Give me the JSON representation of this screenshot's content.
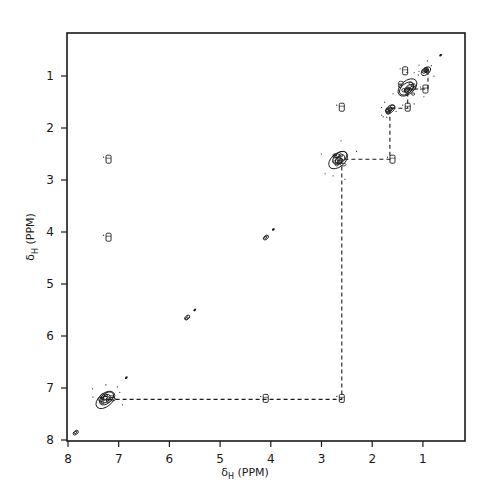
{
  "chart_data": {
    "type": "heatmap",
    "subtype": "2D COSY NMR contour plot",
    "title": "",
    "xlabel": "δH (PPM)",
    "ylabel": "δH (PPM)",
    "xlabel_main": "δ",
    "xlabel_sub": "H",
    "xlabel_unit": "(PPM)",
    "ylabel_main": "δ",
    "ylabel_sub": "H",
    "ylabel_unit": "(PPM)",
    "xlim": [
      8.0,
      0.17
    ],
    "ylim": [
      8.0,
      0.17
    ],
    "x_reversed": true,
    "y_reversed": true,
    "grid": false,
    "x_ticks": [
      8,
      7,
      6,
      5,
      4,
      3,
      2,
      1
    ],
    "y_ticks": [
      1,
      2,
      3,
      4,
      5,
      6,
      7,
      8
    ],
    "x_tick_labels": [
      "8",
      "7",
      "6",
      "5",
      "4",
      "3",
      "2",
      "1"
    ],
    "y_tick_labels": [
      "1",
      "2",
      "3",
      "4",
      "5",
      "6",
      "7",
      "8"
    ],
    "diagonal_peaks": [
      {
        "x": 7.85,
        "y": 7.85,
        "size": "small"
      },
      {
        "x": 7.25,
        "y": 7.2,
        "size": "large"
      },
      {
        "x": 6.85,
        "y": 6.8,
        "size": "tiny"
      },
      {
        "x": 5.65,
        "y": 5.65,
        "size": "small"
      },
      {
        "x": 5.5,
        "y": 5.5,
        "size": "tiny"
      },
      {
        "x": 4.1,
        "y": 4.1,
        "size": "small"
      },
      {
        "x": 3.95,
        "y": 3.95,
        "size": "tiny"
      },
      {
        "x": 2.65,
        "y": 2.6,
        "size": "large"
      },
      {
        "x": 1.65,
        "y": 1.65,
        "size": "medium"
      },
      {
        "x": 1.3,
        "y": 1.25,
        "size": "large"
      },
      {
        "x": 0.95,
        "y": 0.9,
        "size": "medium"
      },
      {
        "x": 0.65,
        "y": 0.6,
        "size": "tiny"
      }
    ],
    "cross_peaks": [
      {
        "x": 2.6,
        "y": 7.2
      },
      {
        "x": 7.2,
        "y": 2.6
      },
      {
        "x": 7.2,
        "y": 4.1
      },
      {
        "x": 4.1,
        "y": 7.2
      },
      {
        "x": 1.6,
        "y": 2.6
      },
      {
        "x": 2.6,
        "y": 1.6
      },
      {
        "x": 1.3,
        "y": 1.6
      },
      {
        "x": 0.95,
        "y": 1.25
      },
      {
        "x": 1.35,
        "y": 0.9
      }
    ],
    "connectivity_path": [
      {
        "x": 7.2,
        "y": 7.22
      },
      {
        "x": 2.6,
        "y": 7.22
      },
      {
        "x": 2.6,
        "y": 2.6
      },
      {
        "x": 1.65,
        "y": 2.6
      },
      {
        "x": 1.65,
        "y": 1.62
      },
      {
        "x": 1.3,
        "y": 1.62
      },
      {
        "x": 1.3,
        "y": 1.25
      },
      {
        "x": 0.9,
        "y": 1.25
      },
      {
        "x": 0.9,
        "y": 0.95
      }
    ],
    "annotations": [
      "dashed lines trace scalar coupling network 7.2 → 2.6 → 1.65 → 1.3 → 0.9 ppm"
    ]
  },
  "colors": {
    "ink": "#1a1a1a",
    "background": "#ffffff"
  }
}
